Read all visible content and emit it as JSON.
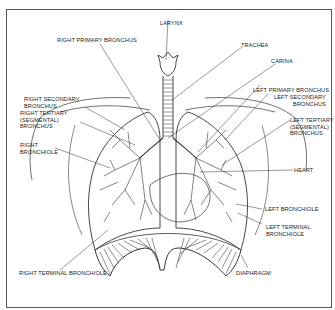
{
  "diagram": {
    "labels": {
      "larynx": "LARYNX",
      "right_primary_bronchus": "RIGHT PRIMARY BRONCHUS",
      "trachea": "TRACHEA",
      "carina": "CARINA",
      "right_secondary_bronchus": "RIGHT SECONDARY\nBRONCHUS",
      "right_tertiary_bronchus": "RIGHT TERTIARY\n(SEGMENTAL)\nBRONCHUS",
      "left_primary_bronchus": "LEFT PRIMARY BRONCHUS",
      "left_secondary_bronchus": "LEFT SECONDARY\nBRONCHUS",
      "left_tertiary_bronchus": "LEFT TERTIARY\n(SEGMENTAL)\nBRONCHUS",
      "right_bronchiole": "RIGHT\nBRONCHIOLE",
      "heart": "HEART",
      "left_bronchiole": "LEFT BRONCHIOLE",
      "left_terminal_bronchiole": "LEFT TERMINAL\nBRONCHIOLE",
      "diaphragm": "DIAPHRAGM",
      "right_terminal_bronchiole": "RIGHT TERMINAL BRONCHIOLE"
    }
  }
}
